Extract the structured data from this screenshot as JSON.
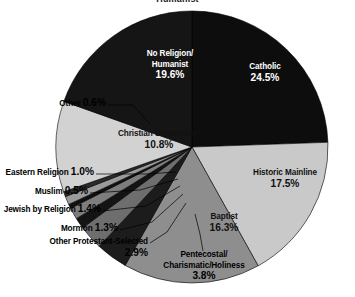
{
  "chart_title": "Humanist",
  "colors": {
    "catholic": "#0d0d0d",
    "historic_mainline": "#c9c9c9",
    "baptist": "#8e8e8e",
    "pentecostal": "#1c1c1c",
    "other_protestant": "#6e6e6e",
    "mormon": "#141414",
    "jewish": "#7d7d7d",
    "muslim": "#101010",
    "eastern": "#9a9a9a",
    "other": "#2a2a2a",
    "christian_unspecified": "#d2d2d2",
    "no_religion": "#151515",
    "outline": "#000000",
    "leader_line": "#000000",
    "background": "#ffffff"
  },
  "chart_data": {
    "type": "pie",
    "title": "Humanist",
    "xlabel": "",
    "ylabel": "",
    "legend_position": "none",
    "grid": false,
    "start_angle_deg": 0,
    "direction": "clockwise",
    "categories": [
      "Catholic",
      "Historic Mainline",
      "Baptist",
      "Pentecostal/Charismatic/Holiness",
      "Other Protestant-Selected",
      "Mormon",
      "Jewish by Religion",
      "Muslim",
      "Eastern Religion",
      "Other",
      "Christian Unspecified",
      "No Religion/Humanist"
    ],
    "values": [
      24.5,
      17.5,
      16.3,
      3.8,
      2.9,
      1.3,
      1.4,
      0.5,
      1.0,
      0.6,
      10.8,
      19.6
    ],
    "unit": "%"
  },
  "slices": [
    {
      "key": "catholic",
      "name": "Catholic",
      "label_line1": "Catholic",
      "value": "24.5%",
      "placement": "inside-dark"
    },
    {
      "key": "historic_mainline",
      "name": "Historic Mainline",
      "label_line1": "Historic Mainline",
      "value": "17.5%",
      "placement": "inside-light"
    },
    {
      "key": "baptist",
      "name": "Baptist",
      "label_line1": "Baptist",
      "value": "16.3%",
      "placement": "inside-light"
    },
    {
      "key": "pentecostal",
      "name": "Pentecostal/Charismatic/Holiness",
      "label_line1": "Pentecostal/",
      "label_line2": "Charismatic/Holiness",
      "value": "3.8%",
      "placement": "outside"
    },
    {
      "key": "other_protestant",
      "name": "Other Protestant-Selected",
      "label_line1": "Other Protestant-Selected",
      "value": "2.9%",
      "placement": "outside"
    },
    {
      "key": "mormon",
      "name": "Mormon",
      "label_line1": "Mormon",
      "value": "1.3%",
      "placement": "outside"
    },
    {
      "key": "jewish",
      "name": "Jewish by Religion",
      "label_line1": "Jewish by Religion",
      "value": "1.4%",
      "placement": "outside"
    },
    {
      "key": "muslim",
      "name": "Muslim",
      "label_line1": "Muslim",
      "value": "0.5%",
      "placement": "outside"
    },
    {
      "key": "eastern",
      "name": "Eastern Religion",
      "label_line1": "Eastern Religion",
      "value": "1.0%",
      "placement": "outside"
    },
    {
      "key": "other",
      "name": "Other",
      "label_line1": "Other",
      "value": "0.6%",
      "placement": "outside"
    },
    {
      "key": "christian_unspecified",
      "name": "Christian Unspecified",
      "label_line1": "Christian Unspecified",
      "value": "10.8%",
      "placement": "inside-light"
    },
    {
      "key": "no_religion",
      "name": "No Religion/Humanist",
      "label_line1": "No Religion/",
      "label_line2": "Humanist",
      "value": "19.6%",
      "placement": "inside-dark"
    }
  ]
}
